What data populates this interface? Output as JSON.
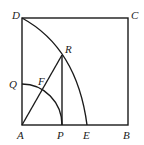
{
  "diagram": {
    "points": {
      "A": {
        "label": "A",
        "x": 22,
        "y": 125
      },
      "B": {
        "label": "B",
        "x": 128,
        "y": 125
      },
      "C": {
        "label": "C",
        "x": 128,
        "y": 18
      },
      "D": {
        "label": "D",
        "x": 22,
        "y": 18
      },
      "P": {
        "label": "P",
        "x": 62,
        "y": 125
      },
      "E": {
        "label": "E",
        "x": 87,
        "y": 125
      },
      "R": {
        "label": "R",
        "x": 62,
        "y": 55
      },
      "Q": {
        "label": "Q",
        "x": 22,
        "y": 84
      },
      "F": {
        "label": "F",
        "x": 42,
        "y": 90
      }
    },
    "segments": [
      "AB",
      "BC",
      "CD",
      "DA",
      "AR",
      "RP"
    ],
    "arcs": [
      "arc DE (through R)",
      "arc QP (center A)"
    ]
  }
}
